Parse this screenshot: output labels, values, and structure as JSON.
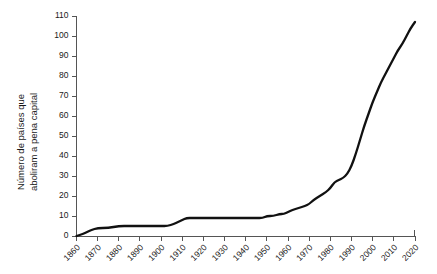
{
  "chart_data": {
    "type": "line",
    "title": "",
    "subtitle": "",
    "xlabel": "",
    "ylabel_line1": "Número de países que",
    "ylabel_line2": "aboliram a pena capital",
    "ylabel": "Número de países que aboliram a pena capital",
    "grid": false,
    "legend": null,
    "legend_position": "none",
    "line_color": "#111111",
    "axis_color": "#555555",
    "background_color": "#ffffff",
    "xlim": [
      1860,
      2020
    ],
    "ylim": [
      0,
      110
    ],
    "xticks": [
      1860,
      1870,
      1880,
      1890,
      1900,
      1910,
      1920,
      1930,
      1940,
      1950,
      1960,
      1970,
      1980,
      1990,
      2000,
      2010,
      2020
    ],
    "xtick_labels": [
      "1860",
      "1870",
      "1880",
      "1890",
      "1900",
      "1910",
      "1920",
      "1930",
      "1940",
      "1950",
      "1960",
      "1970",
      "1980",
      "1990",
      "2000",
      "2010",
      "2020"
    ],
    "xtick_rotation": 45,
    "yticks": [
      0,
      10,
      20,
      30,
      40,
      50,
      60,
      70,
      80,
      90,
      100,
      110
    ],
    "ytick_labels": [
      "0",
      "10",
      "20",
      "30",
      "40",
      "50",
      "60",
      "70",
      "80",
      "90",
      "100",
      "110"
    ],
    "x": [
      1860,
      1863,
      1865,
      1867,
      1870,
      1875,
      1880,
      1885,
      1890,
      1895,
      1900,
      1903,
      1906,
      1908,
      1910,
      1912,
      1915,
      1920,
      1925,
      1930,
      1935,
      1940,
      1945,
      1948,
      1950,
      1953,
      1956,
      1958,
      1960,
      1962,
      1965,
      1968,
      1970,
      1972,
      1975,
      1978,
      1980,
      1982,
      1984,
      1986,
      1988,
      1990,
      1992,
      1994,
      1996,
      1998,
      2000,
      2002,
      2004,
      2006,
      2008,
      2010,
      2012,
      2014,
      2016,
      2018,
      2020
    ],
    "y": [
      0,
      1,
      2,
      3,
      4,
      4,
      5,
      5,
      5,
      5,
      5,
      5,
      6,
      7,
      8,
      9,
      9,
      9,
      9,
      9,
      9,
      9,
      9,
      9,
      10,
      10,
      11,
      11,
      12,
      13,
      14,
      15,
      16,
      18,
      20,
      22,
      24,
      27,
      28,
      29,
      31,
      35,
      41,
      48,
      55,
      61,
      67,
      72,
      77,
      81,
      85,
      89,
      93,
      96,
      100,
      104,
      107
    ],
    "series": [
      {
        "name": "Países que aboliram a pena capital",
        "values": [
          0,
          1,
          2,
          3,
          4,
          4,
          5,
          5,
          5,
          5,
          5,
          5,
          6,
          7,
          8,
          9,
          9,
          9,
          9,
          9,
          9,
          9,
          9,
          9,
          10,
          10,
          11,
          11,
          12,
          13,
          14,
          15,
          16,
          18,
          20,
          22,
          24,
          27,
          28,
          29,
          31,
          35,
          41,
          48,
          55,
          61,
          67,
          72,
          77,
          81,
          85,
          89,
          93,
          96,
          100,
          104,
          107
        ]
      }
    ],
    "annotations": []
  }
}
